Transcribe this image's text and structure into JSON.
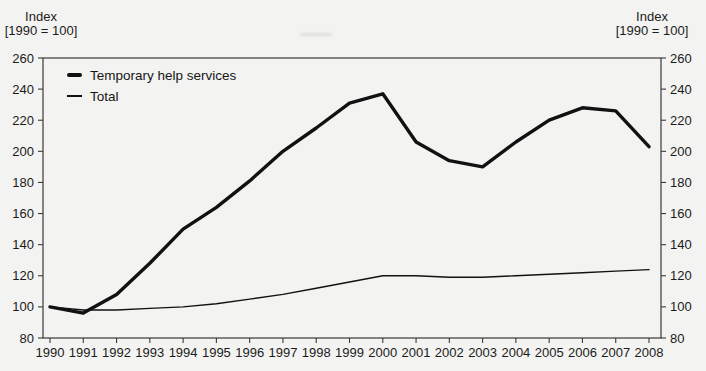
{
  "figure": {
    "background_color": "#f3f3f1",
    "line_color": "#111111",
    "axis_color": "#3a3a3a",
    "text_color": "#1b1b1b"
  },
  "chart_data": {
    "type": "line",
    "title": "",
    "axis_label": {
      "line1": "Index",
      "line2": "[1990 = 100]"
    },
    "x": [
      1990,
      1991,
      1992,
      1993,
      1994,
      1995,
      1996,
      1997,
      1998,
      1999,
      2000,
      2001,
      2002,
      2003,
      2004,
      2005,
      2006,
      2007,
      2008
    ],
    "series": [
      {
        "name": "Temporary help services",
        "style": "thick",
        "values": [
          100,
          96,
          108,
          128,
          150,
          164,
          181,
          200,
          215,
          231,
          237,
          206,
          194,
          190,
          206,
          220,
          228,
          226,
          203
        ]
      },
      {
        "name": "Total",
        "style": "thin",
        "values": [
          100,
          98,
          98,
          99,
          100,
          102,
          105,
          108,
          112,
          116,
          120,
          120,
          119,
          119,
          120,
          121,
          122,
          123,
          124
        ]
      }
    ],
    "ylim": [
      80,
      260
    ],
    "yticks": [
      80,
      100,
      120,
      140,
      160,
      180,
      200,
      220,
      240,
      260
    ],
    "grid": false,
    "legend_position": "top-left-inside",
    "y_axis_on_both_sides": true
  }
}
